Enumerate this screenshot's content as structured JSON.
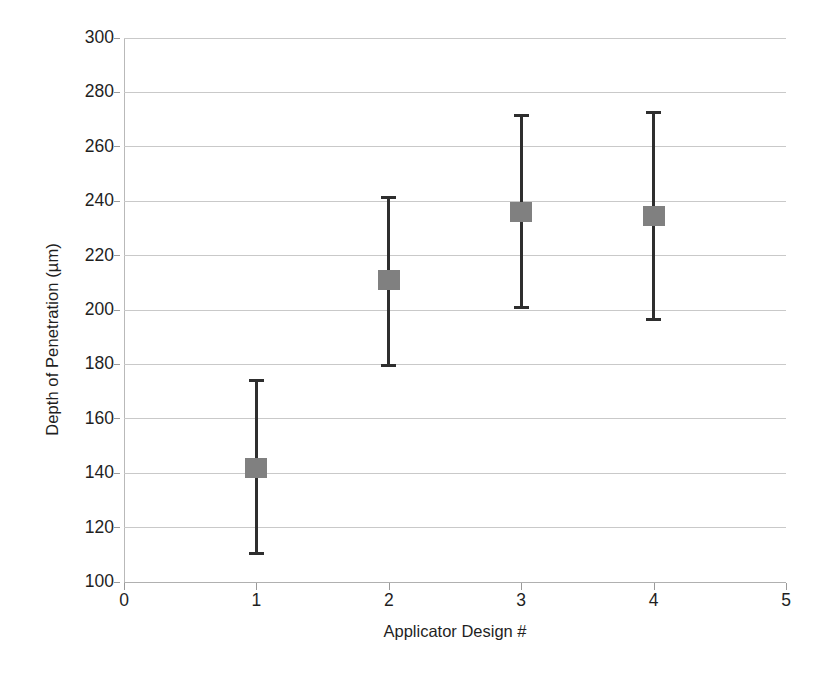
{
  "chart_data": {
    "type": "scatter",
    "title": "",
    "xlabel": "Applicator Design #",
    "ylabel": "Depth of Penetration (µm)",
    "xlim": [
      0,
      5
    ],
    "ylim": [
      100,
      300
    ],
    "xticks": [
      "0",
      "1",
      "2",
      "3",
      "4",
      "5"
    ],
    "yticks": [
      "100",
      "120",
      "140",
      "160",
      "180",
      "200",
      "220",
      "240",
      "260",
      "280",
      "300"
    ],
    "grid": "horizontal",
    "legend": "none",
    "marker_color": "#808080",
    "errorbar_color": "#2e2e2e",
    "gridline_color": "#c9c9c9",
    "x": [
      1,
      2,
      3,
      4
    ],
    "values": [
      142,
      211,
      236,
      234.5
    ],
    "error_low": [
      110,
      179,
      200.5,
      196
    ],
    "error_high": [
      174.5,
      242,
      272,
      273
    ],
    "points": [
      {
        "x": 1,
        "y": 142,
        "low": 110,
        "high": 174.5
      },
      {
        "x": 2,
        "y": 211,
        "low": 179,
        "high": 242
      },
      {
        "x": 3,
        "y": 236,
        "low": 200.5,
        "high": 272
      },
      {
        "x": 4,
        "y": 234.5,
        "low": 196,
        "high": 273
      }
    ]
  },
  "axes": {
    "y_title": "Depth of Penetration (µm)",
    "x_title": "Applicator Design #"
  }
}
